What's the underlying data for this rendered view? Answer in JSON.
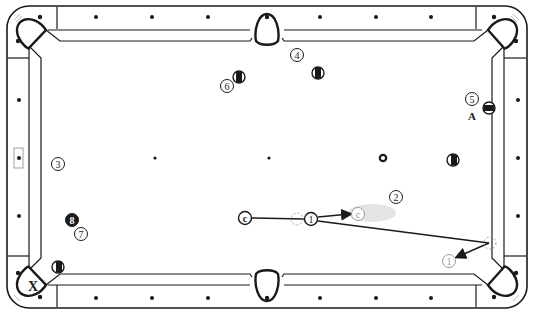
{
  "diagram": {
    "type": "pool-table-shot-diagram",
    "colors": {
      "line": "#1a1a1a",
      "cloth": "#ffffff",
      "ghost": "#9a9a9a",
      "cue_path_shade": "#e6e6e6",
      "ghost_ball_dashed": "#a0a0a0"
    },
    "labels": {
      "corner_pocket_target": "X",
      "position_marker": "A"
    },
    "balls": [
      {
        "id": "ball-1",
        "label": "1",
        "x": 311,
        "y": 219,
        "style": "numbered"
      },
      {
        "id": "ball-2",
        "label": "2",
        "x": 396,
        "y": 197,
        "style": "numbered"
      },
      {
        "id": "ball-3",
        "label": "3",
        "x": 58,
        "y": 164,
        "style": "numbered"
      },
      {
        "id": "ball-4",
        "label": "4",
        "x": 297,
        "y": 55,
        "style": "numbered"
      },
      {
        "id": "ball-5",
        "label": "5",
        "x": 472,
        "y": 99,
        "style": "numbered"
      },
      {
        "id": "ball-6",
        "label": "6",
        "x": 227,
        "y": 86,
        "style": "numbered"
      },
      {
        "id": "ball-7",
        "label": "7",
        "x": 81,
        "y": 234,
        "style": "numbered"
      },
      {
        "id": "ball-8",
        "label": "8",
        "x": 72,
        "y": 220,
        "style": "solid-black"
      },
      {
        "id": "cue-ball",
        "label": "c",
        "x": 245,
        "y": 218,
        "style": "numbered"
      },
      {
        "id": "cue-ball-final",
        "label": "c",
        "x": 358,
        "y": 214,
        "style": "ghost"
      },
      {
        "id": "ball-1-pocketed-path",
        "label": "1",
        "x": 449,
        "y": 261,
        "style": "ghost"
      }
    ],
    "striped_balls": [
      {
        "id": "striped-a",
        "x": 239,
        "y": 77
      },
      {
        "id": "striped-b",
        "x": 318,
        "y": 73
      },
      {
        "id": "striped-c",
        "x": 489,
        "y": 108,
        "horizontal": true
      },
      {
        "id": "striped-d",
        "x": 453,
        "y": 160
      },
      {
        "id": "striped-e",
        "x": 58,
        "y": 267
      }
    ],
    "spots": [
      {
        "id": "head-spot",
        "x": 155,
        "y": 158
      },
      {
        "id": "center-spot",
        "x": 269,
        "y": 158
      },
      {
        "id": "foot-spot",
        "x": 383,
        "y": 158,
        "ring": true
      }
    ],
    "ghost_balls": [
      {
        "id": "contact-ghost-1",
        "x": 297,
        "y": 219
      },
      {
        "id": "contact-ghost-rail",
        "x": 490,
        "y": 243
      }
    ],
    "paths": [
      {
        "id": "cue-to-contact",
        "points": [
          [
            252,
            218
          ],
          [
            304,
            219
          ]
        ],
        "arrow": false
      },
      {
        "id": "cue-deflection",
        "points": [
          [
            318,
            217
          ],
          [
            351,
            214
          ]
        ],
        "arrow": true
      },
      {
        "id": "object-ball-to-rail",
        "points": [
          [
            318,
            221
          ],
          [
            490,
            243
          ]
        ],
        "arrow": false
      },
      {
        "id": "rail-rebound",
        "points": [
          [
            490,
            243
          ],
          [
            456,
            258
          ]
        ],
        "arrow": true
      }
    ]
  }
}
